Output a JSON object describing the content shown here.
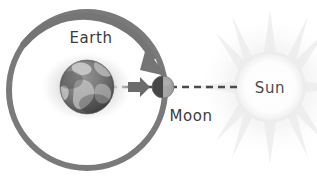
{
  "diagram": {
    "background_color": "#ffffff",
    "labels": {
      "earth": "Earth",
      "moon": "Moon",
      "sun": "Sun"
    },
    "bodies": [
      {
        "name": "earth",
        "label": "Earth",
        "cx": 87,
        "cy": 87,
        "r": 27,
        "color": "#6e6e6e",
        "halo": "#e2e2e2",
        "description": "grayscale globe with continents and soft elliptical glow"
      },
      {
        "name": "moon",
        "label": "Moon",
        "cx": 163,
        "cy": 87,
        "r": 11,
        "color": "#8f8f8f",
        "shadow_color": "#3f3f3f",
        "description": "small sphere, dark left half facing away from Sun"
      },
      {
        "name": "sun",
        "label": "Sun",
        "cx": 270,
        "cy": 87,
        "r": 35,
        "color": "#fbfbfb",
        "ray_color": "#ededed",
        "description": "pale disc with faint radiating rays"
      }
    ],
    "orbit": {
      "name": "moon-orbit",
      "cx": 87,
      "cy": 90,
      "r": 78,
      "stroke": "#7a7a7a",
      "stroke_width": 6,
      "direction": "clockwise",
      "arrow_label": "orbit direction arrow"
    },
    "sight_line": {
      "name": "earth-sun-sight-line",
      "y": 87,
      "x_start": 60,
      "x_end": 240,
      "stroke": "#4a4a4a",
      "dash": "7 5"
    },
    "motion_arrow": {
      "name": "moon-motion-arrow",
      "x": 133,
      "y": 87,
      "color": "#6b6b6b",
      "points_to": "sun"
    }
  },
  "colors": {
    "background": "#ffffff",
    "ink": "#3b3b3b",
    "orbit_gray": "#7a7a7a",
    "earth_gray": "#6e6e6e",
    "halo_gray": "#e2e2e2",
    "sun_pale": "#fbfbfb"
  }
}
